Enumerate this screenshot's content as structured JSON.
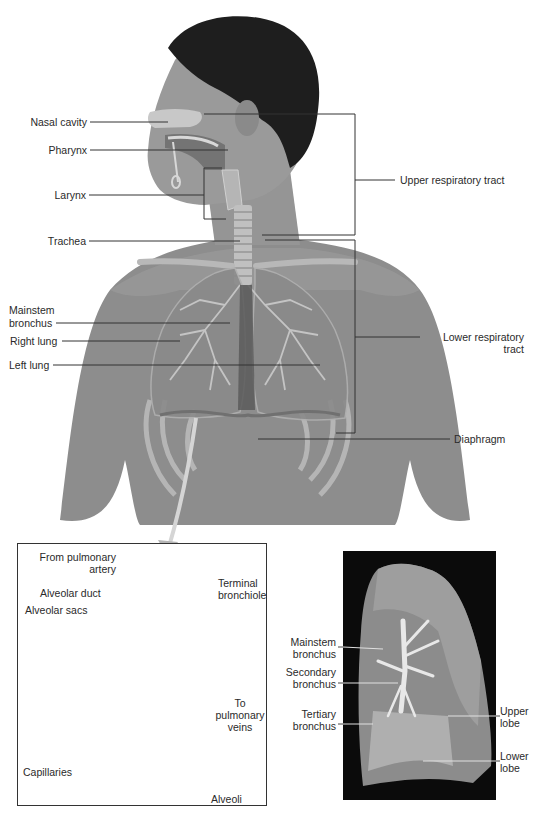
{
  "figure": {
    "main_diagram": {
      "title": "Respiratory system",
      "labels": {
        "nasal_cavity": "Nasal cavity",
        "pharynx": "Pharynx",
        "larynx": "Larynx",
        "trachea": "Trachea",
        "mainstem_bronchus_line1": "Mainstem",
        "mainstem_bronchus_line2": "bronchus",
        "right_lung": "Right lung",
        "left_lung": "Left lung",
        "upper_respiratory_tract": "Upper respiratory tract",
        "lower_respiratory_tract_line1": "Lower respiratory",
        "lower_respiratory_tract_line2": "tract",
        "diaphragm": "Diaphragm"
      }
    },
    "alveoli_inset": {
      "labels": {
        "from_pulmonary_artery_line1": "From pulmonary",
        "from_pulmonary_artery_line2": "artery",
        "alveolar_duct": "Alveolar duct",
        "alveolar_sacs": "Alveolar sacs",
        "terminal_bronchiole_line1": "Terminal",
        "terminal_bronchiole_line2": "bronchiole",
        "to_pulmonary_veins_line1": "To",
        "to_pulmonary_veins_line2": "pulmonary",
        "to_pulmonary_veins_line3": "veins",
        "capillaries": "Capillaries",
        "alveoli": "Alveoli"
      }
    },
    "lung_photo": {
      "labels": {
        "mainstem_bronchus_line1": "Mainstem",
        "mainstem_bronchus_line2": "bronchus",
        "secondary_bronchus_line1": "Secondary",
        "secondary_bronchus_line2": "bronchus",
        "tertiary_bronchus_line1": "Tertiary",
        "tertiary_bronchus_line2": "bronchus",
        "upper_lobe_line1": "Upper",
        "upper_lobe_line2": "lobe",
        "lower_lobe_line1": "Lower",
        "lower_lobe_line2": "lobe"
      }
    },
    "colors": {
      "skin": "#8c8c8c",
      "skin_light": "#a8a8a8",
      "hair": "#1e1e1e",
      "lung": "#9a9a9a",
      "leader_line": "#333333",
      "photo_bg": "#0b0b0b"
    }
  }
}
